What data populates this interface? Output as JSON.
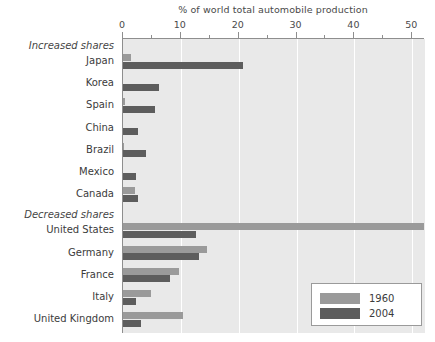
{
  "chart_data": {
    "type": "bar",
    "orientation": "horizontal",
    "title": "% of world total automobile production",
    "xlabel": "% of world total automobile production",
    "ylabel": "",
    "xlim": [
      0,
      52.2
    ],
    "grid": true,
    "legend_position": "bottom-right",
    "xticks": [
      0,
      10,
      20,
      30,
      40,
      50
    ],
    "xtick_labels": [
      "0",
      "10",
      "20",
      "30",
      "40",
      "50"
    ],
    "minor_xticks": [
      5,
      15,
      25,
      35,
      45
    ],
    "categories": [
      "Japan",
      "Korea",
      "Spain",
      "China",
      "Brazil",
      "Mexico",
      "Canada",
      "United States",
      "Germany",
      "France",
      "Italy",
      "United Kingdom"
    ],
    "series": [
      {
        "name": "1960",
        "color": "#9a9a9a",
        "values": [
          1.3,
          0.0,
          0.3,
          0.0,
          0.2,
          0.0,
          2.0,
          52.0,
          14.5,
          9.6,
          4.8,
          10.4
        ]
      },
      {
        "name": "2004",
        "color": "#5d5d5d",
        "values": [
          20.8,
          6.3,
          5.5,
          2.6,
          3.9,
          2.2,
          2.6,
          12.7,
          13.1,
          8.2,
          2.2,
          3.1
        ]
      }
    ],
    "sections": [
      {
        "label": "Increased shares",
        "categories": [
          "Japan",
          "Korea",
          "Spain",
          "China",
          "Brazil",
          "Mexico",
          "Canada"
        ]
      },
      {
        "label": "Decreased shares",
        "categories": [
          "United States",
          "Germany",
          "France",
          "Italy",
          "United Kingdom"
        ]
      }
    ]
  },
  "legend": {
    "title": "",
    "entries": [
      {
        "label": "1960",
        "color": "#9a9a9a"
      },
      {
        "label": "2004",
        "color": "#5d5d5d"
      }
    ]
  },
  "colors": {
    "plot_background": "#e9e9e9",
    "gridline": "#ffffff",
    "axis": "#8e8e8e",
    "series_1960": "#9a9a9a",
    "series_2004": "#5d5d5d",
    "text": "#3b3b3b"
  }
}
